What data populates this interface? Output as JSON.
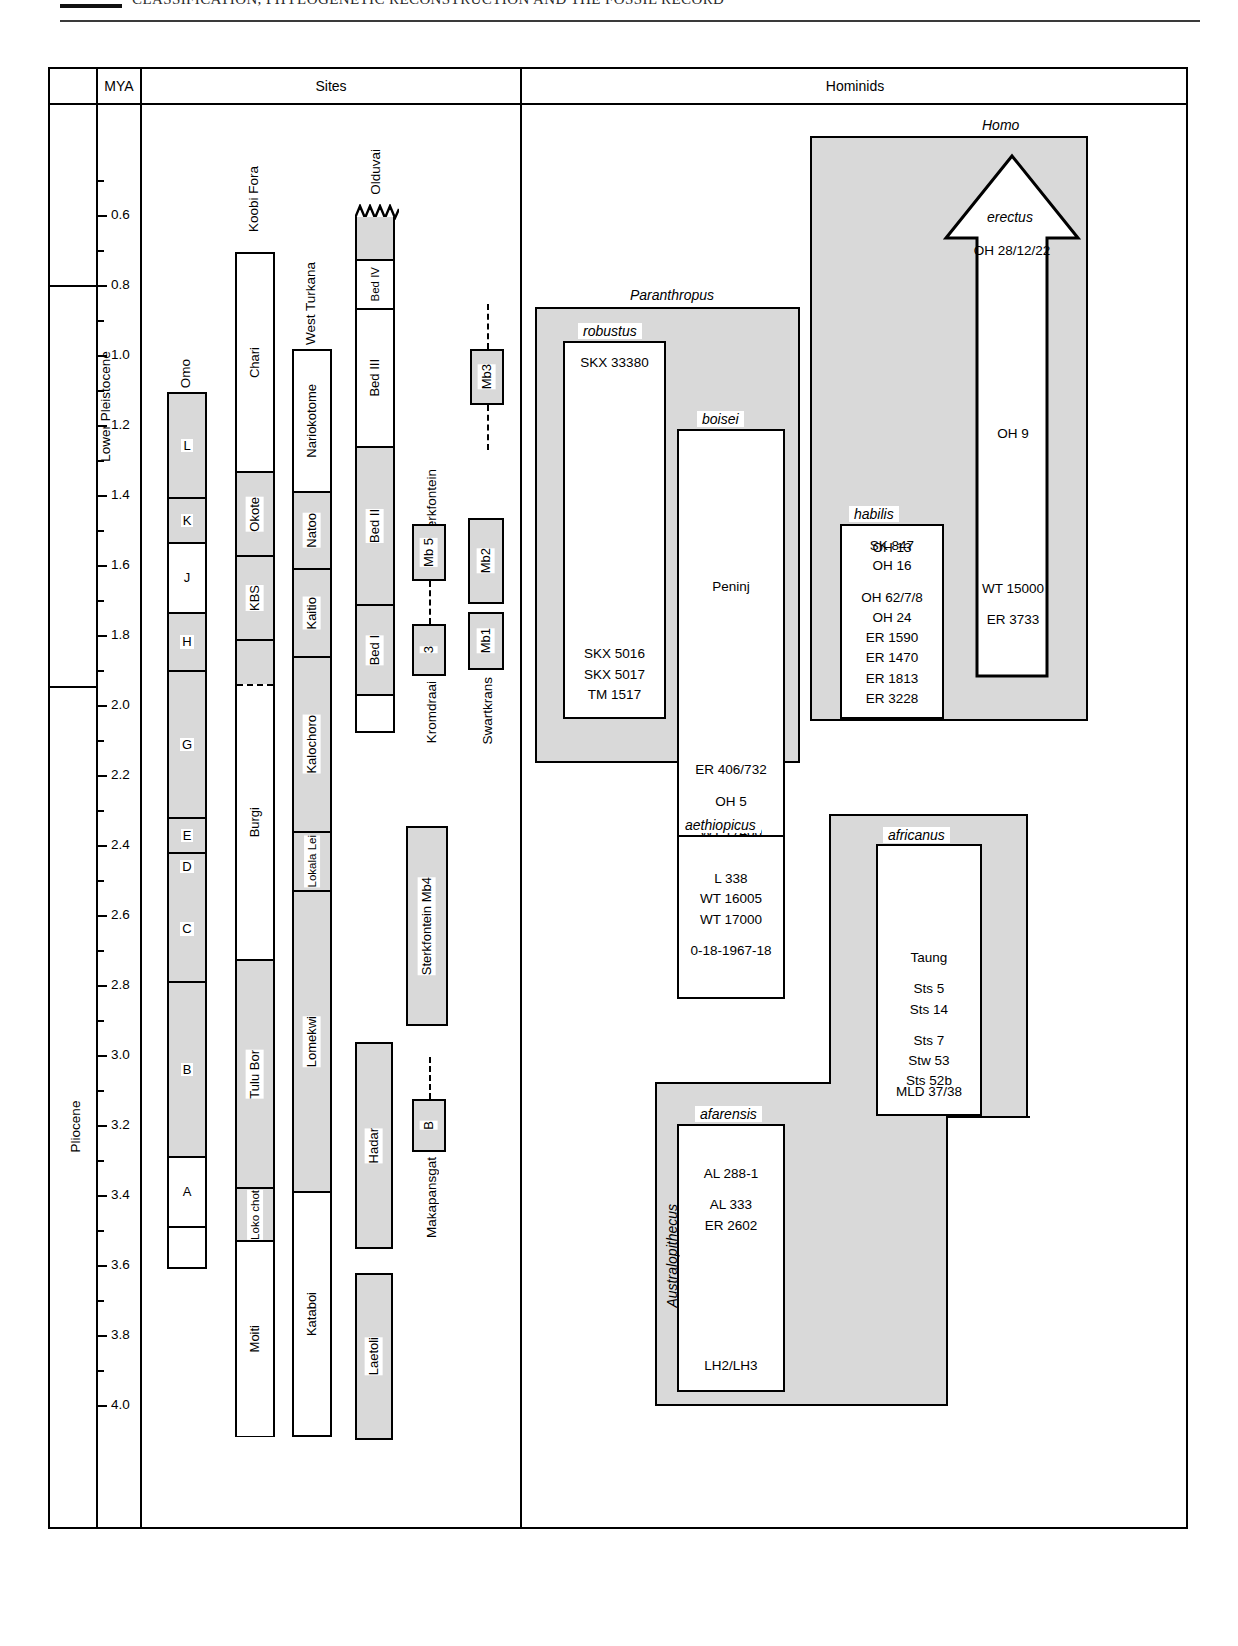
{
  "page": {
    "running_head": "CLASSIFICATION, PHYLOGENETIC RECONSTRUCTION AND THE FOSSIL RECORD"
  },
  "header": {
    "col_blank": "",
    "col_mya": "MYA",
    "col_sites": "Sites",
    "col_hominids": "Hominids"
  },
  "axis": {
    "label": "MYA",
    "ticks": [
      "0.6",
      "0.8",
      "1.0",
      "1.2",
      "1.4",
      "1.6",
      "1.8",
      "2.0",
      "2.2",
      "2.4",
      "2.6",
      "2.8",
      "3.0",
      "3.2",
      "3.4",
      "3.6",
      "3.8",
      "4.0"
    ],
    "epochs": [
      {
        "name": "Lower Pleistocene",
        "from": 0.73,
        "to": 1.8
      },
      {
        "name": "Pliocene",
        "from": 1.8,
        "to": 4.05
      }
    ]
  },
  "sites": {
    "columns": [
      {
        "name": "Omo",
        "units": [
          {
            "label": "L",
            "shaded": true
          },
          {
            "label": "K",
            "shaded": true
          },
          {
            "label": "J",
            "shaded": false
          },
          {
            "label": "H",
            "shaded": true
          },
          {
            "label": "G",
            "shaded": true
          },
          {
            "label": "E",
            "shaded": true
          },
          {
            "label": "D",
            "shaded": true
          },
          {
            "label": "C",
            "shaded": true
          },
          {
            "label": "B",
            "shaded": true
          },
          {
            "label": "A",
            "shaded": false
          },
          {
            "label": "",
            "shaded": false
          }
        ]
      },
      {
        "name": "Koobi Fora",
        "units": [
          {
            "label": "Chari",
            "shaded": false
          },
          {
            "label": "Okote",
            "shaded": true
          },
          {
            "label": "KBS",
            "shaded": true
          },
          {
            "label": "",
            "shaded": true
          },
          {
            "label": "Burgi",
            "shaded": false
          },
          {
            "label": "Tulu Bor",
            "shaded": true
          },
          {
            "label": "Loko chot",
            "shaded": true
          },
          {
            "label": "Moiti",
            "shaded": false
          }
        ]
      },
      {
        "name": "West Turkana",
        "units": [
          {
            "label": "Nariokotome",
            "shaded": false
          },
          {
            "label": "Natoo",
            "shaded": true
          },
          {
            "label": "Kaitio",
            "shaded": true
          },
          {
            "label": "Kalochoro",
            "shaded": true
          },
          {
            "label": "Lokala Lei",
            "shaded": true
          },
          {
            "label": "Lomekwi",
            "shaded": true
          },
          {
            "label": "Kataboi",
            "shaded": false
          }
        ]
      },
      {
        "name": "Olduvai",
        "units": [
          {
            "label": "",
            "shaded": true
          },
          {
            "label": "Bed IV",
            "shaded": false
          },
          {
            "label": "Bed III",
            "shaded": false
          },
          {
            "label": "Bed II",
            "shaded": true
          },
          {
            "label": "Bed I",
            "shaded": true
          },
          {
            "label": "",
            "shaded": false
          }
        ]
      }
    ],
    "members": [
      {
        "site": "Sterkfontein",
        "label": "Mb3"
      },
      {
        "site": "Sterkfontein",
        "label": "Mb 5"
      },
      {
        "site": "Kromdraai",
        "label": "3"
      },
      {
        "site": "Swartkrans",
        "label": "Mb2"
      },
      {
        "site": "Swartkrans",
        "label": "Mb1"
      },
      {
        "site": "Sterkfontein Mb4",
        "label": "Sterkfontein Mb4"
      },
      {
        "site": "Makapansgat",
        "label": "B"
      },
      {
        "site": "Hadar",
        "label": "Hadar"
      },
      {
        "site": "Laetoli",
        "label": "Laetoli"
      }
    ],
    "side_labels": [
      "Sterkfontein",
      "Kromdraai",
      "Swartkrans",
      "Makapansgat"
    ]
  },
  "hominids": {
    "genera": [
      {
        "name": "Paranthropus"
      },
      {
        "name": "Homo"
      },
      {
        "name": "Australopithecus"
      }
    ],
    "taxa": [
      {
        "genus": "Paranthropus",
        "name": "robustus",
        "specimens": [
          [
            "SKX 33380"
          ],
          [
            "SKX 5016",
            "SKX 5017",
            "TM 1517"
          ]
        ]
      },
      {
        "genus": "Paranthropus",
        "name": "boisei",
        "specimens": [
          [
            "Peninj"
          ],
          [
            "ER 406/732"
          ],
          [
            "OH 5"
          ],
          [
            "WT 17400"
          ]
        ]
      },
      {
        "genus": "Paranthropus",
        "name": "aethiopicus",
        "specimens": [
          [
            "L 338",
            "WT 16005",
            "WT 17000"
          ],
          [
            "0-18-1967-18"
          ]
        ]
      },
      {
        "genus": "Homo",
        "name": "erectus",
        "specimens": [
          [
            "OH  28/12/22"
          ],
          [
            "OH 9"
          ],
          [
            "WT 15000"
          ],
          [
            "ER 3733"
          ]
        ]
      },
      {
        "genus": "Homo",
        "name": "habilis",
        "specimens": [
          [
            "OH 13"
          ],
          [
            "SK 847",
            "OH 16"
          ],
          [
            "OH 62/7/8",
            "OH 24",
            "ER 1590",
            "ER 1470",
            "ER 1813",
            "ER 3228"
          ]
        ]
      },
      {
        "genus": "Australopithecus",
        "name": "africanus",
        "specimens": [
          [
            "Taung"
          ],
          [
            "Sts 5",
            "Sts 14"
          ],
          [
            "Sts 7",
            "Stw 53",
            "Sts 52b"
          ],
          [
            "MLD 37/38"
          ]
        ]
      },
      {
        "genus": "Australopithecus",
        "name": "afarensis",
        "specimens": [
          [
            "AL 288-1"
          ],
          [
            "AL 333",
            "ER 2602"
          ],
          [
            "LH2/LH3"
          ]
        ]
      }
    ]
  },
  "chart_data": {
    "type": "table",
    "ylabel": "MYA",
    "ylim": [
      0.5,
      4.05
    ],
    "grid": false,
    "legend": "none",
    "site_ranges": [
      {
        "site": "Omo",
        "unit": "L",
        "from": 1.1,
        "to": 1.4,
        "shaded": true
      },
      {
        "site": "Omo",
        "unit": "K",
        "from": 1.4,
        "to": 1.53,
        "shaded": true
      },
      {
        "site": "Omo",
        "unit": "J",
        "from": 1.53,
        "to": 1.73,
        "shaded": false
      },
      {
        "site": "Omo",
        "unit": "H",
        "from": 1.73,
        "to": 1.9,
        "shaded": true
      },
      {
        "site": "Omo",
        "unit": "G",
        "from": 1.9,
        "to": 2.32,
        "shaded": true
      },
      {
        "site": "Omo",
        "unit": "E",
        "from": 2.32,
        "to": 2.43,
        "shaded": true
      },
      {
        "site": "Omo",
        "unit": "D",
        "from": 2.43,
        "to": 2.5,
        "shaded": true
      },
      {
        "site": "Omo",
        "unit": "C",
        "from": 2.5,
        "to": 2.8,
        "shaded": true
      },
      {
        "site": "Omo",
        "unit": "B",
        "from": 2.8,
        "to": 3.3,
        "shaded": true
      },
      {
        "site": "Omo",
        "unit": "A",
        "from": 3.3,
        "to": 3.5,
        "shaded": false
      },
      {
        "site": "Omo",
        "unit": "",
        "from": 3.5,
        "to": 3.62,
        "shaded": false
      },
      {
        "site": "Koobi Fora",
        "unit": "Chari",
        "from": 0.7,
        "to": 1.32,
        "shaded": false
      },
      {
        "site": "Koobi Fora",
        "unit": "Okote",
        "from": 1.32,
        "to": 1.56,
        "shaded": true
      },
      {
        "site": "Koobi Fora",
        "unit": "KBS",
        "from": 1.56,
        "to": 1.8,
        "shaded": true
      },
      {
        "site": "Koobi Fora",
        "unit": "",
        "from": 1.8,
        "to": 1.93,
        "shaded": true
      },
      {
        "site": "Koobi Fora",
        "unit": "Burgi",
        "from": 1.93,
        "to": 2.72,
        "shaded": false
      },
      {
        "site": "Koobi Fora",
        "unit": "Tulu Bor",
        "from": 2.72,
        "to": 3.37,
        "shaded": true
      },
      {
        "site": "Koobi Fora",
        "unit": "Loko chot",
        "from": 3.37,
        "to": 3.52,
        "shaded": true
      },
      {
        "site": "Koobi Fora",
        "unit": "Moiti",
        "from": 3.52,
        "to": 4.03,
        "shaded": false
      },
      {
        "site": "West Turkana",
        "unit": "Nariokotome",
        "from": 0.98,
        "to": 1.38,
        "shaded": false
      },
      {
        "site": "West Turkana",
        "unit": "Natoo",
        "from": 1.38,
        "to": 1.6,
        "shaded": true
      },
      {
        "site": "West Turkana",
        "unit": "Kaitio",
        "from": 1.6,
        "to": 1.85,
        "shaded": true
      },
      {
        "site": "West Turkana",
        "unit": "Kalochoro",
        "from": 1.85,
        "to": 2.35,
        "shaded": true
      },
      {
        "site": "West Turkana",
        "unit": "Lokala Lei",
        "from": 2.35,
        "to": 2.52,
        "shaded": true
      },
      {
        "site": "West Turkana",
        "unit": "Lomekwi",
        "from": 2.52,
        "to": 3.38,
        "shaded": true
      },
      {
        "site": "West Turkana",
        "unit": "Kataboi",
        "from": 3.38,
        "to": 4.03,
        "shaded": false
      },
      {
        "site": "Olduvai",
        "unit": "",
        "from": 0.57,
        "to": 0.7,
        "shaded": true
      },
      {
        "site": "Olduvai",
        "unit": "Bed IV",
        "from": 0.7,
        "to": 0.85,
        "shaded": false
      },
      {
        "site": "Olduvai",
        "unit": "Bed III",
        "from": 0.85,
        "to": 1.25,
        "shaded": false
      },
      {
        "site": "Olduvai",
        "unit": "Bed II",
        "from": 1.25,
        "to": 1.7,
        "shaded": true
      },
      {
        "site": "Olduvai",
        "unit": "Bed I",
        "from": 1.7,
        "to": 1.95,
        "shaded": true
      },
      {
        "site": "Olduvai",
        "unit": "",
        "from": 1.95,
        "to": 2.22,
        "shaded": false
      },
      {
        "site": "Sterkfontein",
        "unit": "Mb3",
        "from": 0.92,
        "to": 1.08,
        "shaded": true
      },
      {
        "site": "Sterkfontein",
        "unit": "Mb 5",
        "from": 1.46,
        "to": 1.62,
        "shaded": true
      },
      {
        "site": "Sterkfontein",
        "unit": "Sterkfontein Mb4",
        "from": 2.3,
        "to": 2.88,
        "shaded": true
      },
      {
        "site": "Kromdraai",
        "unit": "3",
        "from": 1.72,
        "to": 1.86,
        "shaded": true
      },
      {
        "site": "Swartkrans",
        "unit": "Mb2",
        "from": 1.45,
        "to": 1.75,
        "shaded": true
      },
      {
        "site": "Swartkrans",
        "unit": "Mb1",
        "from": 1.75,
        "to": 1.88,
        "shaded": true
      },
      {
        "site": "Makapansgat",
        "unit": "B",
        "from": 2.95,
        "to": 3.1,
        "shaded": true
      },
      {
        "site": "Hadar",
        "unit": "Hadar",
        "from": 2.88,
        "to": 3.35,
        "shaded": true
      },
      {
        "site": "Laetoli",
        "unit": "Laetoli",
        "from": 3.52,
        "to": 3.88,
        "shaded": true
      }
    ],
    "taxon_ranges": [
      {
        "taxon": "Paranthropus",
        "from": 0.84,
        "to": 2.68
      },
      {
        "taxon": "robustus",
        "from": 0.93,
        "to": 1.82
      },
      {
        "taxon": "boisei",
        "from": 1.16,
        "to": 2.24
      },
      {
        "taxon": "aethiopicus",
        "from": 2.3,
        "to": 2.68
      },
      {
        "taxon": "Homo",
        "from": 0.52,
        "to": 2.0
      },
      {
        "taxon": "erectus",
        "from": 0.56,
        "to": 1.82
      },
      {
        "taxon": "habilis",
        "from": 1.41,
        "to": 1.97
      },
      {
        "taxon": "Australopithecus",
        "from": 2.24,
        "to": 3.82
      },
      {
        "taxon": "africanus",
        "from": 2.27,
        "to": 3.1
      },
      {
        "taxon": "afarensis",
        "from": 2.88,
        "to": 3.8
      }
    ]
  }
}
